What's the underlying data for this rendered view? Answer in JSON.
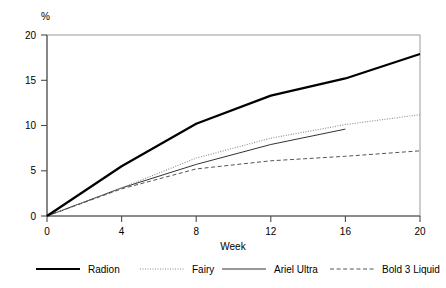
{
  "chart_data": {
    "type": "line",
    "title": "",
    "xlabel": "Week",
    "ylabel": "%",
    "xlim": [
      0,
      20
    ],
    "ylim": [
      0,
      20
    ],
    "xticks": [
      0,
      4,
      8,
      12,
      16,
      20
    ],
    "yticks": [
      0,
      5,
      10,
      15,
      20
    ],
    "xtick_labels": [
      "0",
      "4",
      "8",
      "12",
      "16",
      "20"
    ],
    "ytick_labels": [
      "0",
      "5",
      "10",
      "15",
      "20"
    ],
    "grid": false,
    "legend_position": "below",
    "x": [
      0,
      4,
      8,
      12,
      16,
      20
    ],
    "series": [
      {
        "name": "Radion",
        "style": "solid-thick",
        "color": "#000000",
        "x": [
          0,
          4,
          8,
          12,
          16,
          20
        ],
        "values": [
          0,
          5.5,
          10.2,
          13.3,
          15.2,
          17.9
        ]
      },
      {
        "name": "Fairy",
        "style": "dotted",
        "color": "#8c8c8c",
        "x": [
          0,
          4,
          8,
          12,
          16,
          20
        ],
        "values": [
          0,
          3.1,
          6.4,
          8.6,
          10.1,
          11.2
        ]
      },
      {
        "name": "Ariel Ultra",
        "style": "solid-thin",
        "color": "#333333",
        "x": [
          0,
          4,
          8,
          12,
          16
        ],
        "values": [
          0,
          3.1,
          5.7,
          7.9,
          9.6
        ]
      },
      {
        "name": "Bold 3 Liquid",
        "style": "dashed",
        "color": "#555555",
        "x": [
          0,
          4,
          8,
          12,
          16,
          20
        ],
        "values": [
          0,
          3.0,
          5.2,
          6.1,
          6.6,
          7.2
        ]
      }
    ]
  },
  "axes": {
    "y_unit_label": "%",
    "x_axis_label": "Week"
  },
  "legend": {
    "items": [
      {
        "label": "Radion",
        "style": "solid-thick"
      },
      {
        "label": "Fairy",
        "style": "dotted"
      },
      {
        "label": "Ariel Ultra",
        "style": "solid-thin"
      },
      {
        "label": "Bold 3 Liquid",
        "style": "dashed"
      }
    ]
  },
  "colors": {
    "frame": "#9a9a9a",
    "axis": "#4d4d4d",
    "radion": "#000000",
    "fairy": "#8c8c8c",
    "ariel": "#333333",
    "bold": "#555555"
  }
}
